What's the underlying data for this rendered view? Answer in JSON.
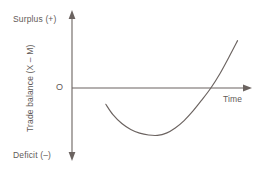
{
  "chart_data": {
    "type": "line",
    "title": "",
    "subtitle": "",
    "xlabel": "Time",
    "ylabel": "Trade balance (X – M)",
    "axis_top_label": "Surplus (+)",
    "axis_bottom_label": "Deficit (–)",
    "origin_label": "O",
    "grid": false,
    "legend": null,
    "line_color": "#6b6360",
    "axis_color": "#6b6360",
    "xlim": [
      0,
      10
    ],
    "ylim": [
      -10,
      10
    ],
    "series": [
      {
        "name": "Trade balance (J-curve)",
        "x": [
          1.9,
          2.3,
          2.8,
          3.3,
          3.8,
          4.3,
          4.8,
          5.3,
          5.8,
          6.3,
          6.8,
          7.3,
          7.8,
          8.3,
          8.8,
          9.3
        ],
        "values": [
          -2.2,
          -3.6,
          -4.8,
          -5.6,
          -6.1,
          -6.35,
          -6.4,
          -6.1,
          -5.4,
          -4.4,
          -3.1,
          -1.6,
          0.0,
          1.9,
          4.1,
          6.4
        ]
      }
    ],
    "annotations": [
      {
        "name": "curve-start",
        "x": 1.9,
        "y": -2.2
      },
      {
        "name": "curve-trough",
        "x": 4.85,
        "y": -6.4
      },
      {
        "name": "zero-crossing",
        "x": 7.8,
        "y": 0.0
      },
      {
        "name": "curve-end",
        "x": 9.3,
        "y": 6.4
      }
    ]
  }
}
